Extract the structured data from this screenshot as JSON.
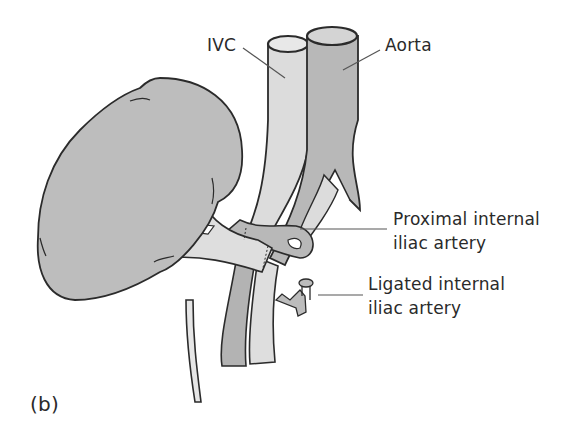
{
  "figure": {
    "panel_label": "(b)",
    "labels": {
      "ivc": "IVC",
      "aorta": "Aorta",
      "proximal_line1": "Proximal internal",
      "proximal_line2": "iliac artery",
      "ligated_line1": "Ligated internal",
      "ligated_line2": "iliac artery"
    },
    "structures": [
      "kidney",
      "IVC",
      "aorta",
      "renal artery",
      "renal vein",
      "ureter",
      "external iliac artery",
      "external iliac vein",
      "proximal internal iliac artery",
      "ligated internal iliac artery"
    ],
    "colors": {
      "kidney": "#bdbdbd",
      "artery": "#b3b3b3",
      "vein": "#dcdcdc",
      "outline": "#2b2b2b",
      "leader": "#555555"
    }
  }
}
